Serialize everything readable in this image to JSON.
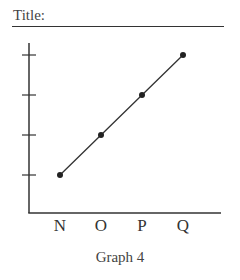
{
  "header": {
    "title_label": "Title:"
  },
  "chart_data": {
    "type": "line",
    "title": "",
    "caption": "Graph 4",
    "xlabel": "",
    "ylabel": "",
    "categories": [
      "N",
      "O",
      "P",
      "Q"
    ],
    "y_ticks": [
      1,
      2,
      3,
      4
    ],
    "y_tick_labels": [
      "",
      "",
      "",
      ""
    ],
    "ylim": [
      0,
      4.4
    ],
    "grid": false,
    "series": [
      {
        "name": "series",
        "values": [
          1,
          2,
          3,
          4
        ],
        "color": "#333333"
      }
    ]
  }
}
